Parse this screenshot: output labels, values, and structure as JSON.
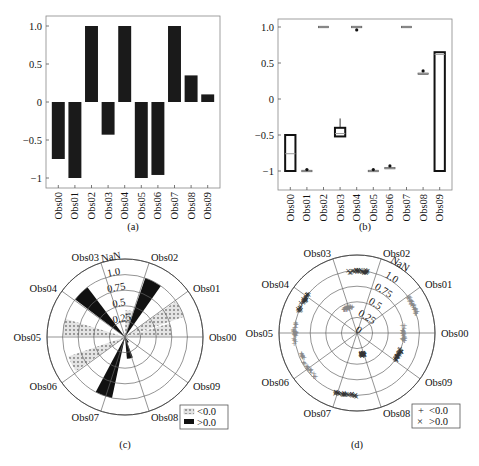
{
  "chart_data": [
    {
      "id": "a",
      "type": "bar",
      "caption": "(a)",
      "categories": [
        "Obs00",
        "Obs01",
        "Obs02",
        "Obs03",
        "Obs04",
        "Obs05",
        "Obs06",
        "Obs07",
        "Obs08",
        "Obs09"
      ],
      "values": [
        -0.75,
        -1.0,
        1.0,
        -0.43,
        1.0,
        -1.0,
        -0.96,
        1.0,
        0.35,
        0.1
      ],
      "yticks": [
        "1.0",
        "0.5",
        "0",
        "-0.5",
        "-1"
      ],
      "ytick_values": [
        1.0,
        0.5,
        0,
        -0.5,
        -1
      ],
      "ylim": [
        -1.1,
        1.1
      ],
      "color": "#1a1a1a",
      "grid": false
    },
    {
      "id": "b",
      "type": "box",
      "caption": "(b)",
      "categories": [
        "Obs00",
        "Obs01",
        "Obs02",
        "Obs03",
        "Obs04",
        "Obs05",
        "Obs06",
        "Obs07",
        "Obs08",
        "Obs09"
      ],
      "boxes": [
        {
          "q1": -1.0,
          "median": -0.76,
          "q3": -0.5,
          "whisker_low": -1.0,
          "whisker_high": -0.5,
          "outliers": []
        },
        {
          "q1": -1.0,
          "median": -1.0,
          "q3": -1.0,
          "whisker_low": -1.0,
          "whisker_high": -1.0,
          "outliers": [
            -0.98
          ]
        },
        {
          "q1": 1.0,
          "median": 1.0,
          "q3": 1.0,
          "whisker_low": 1.0,
          "whisker_high": 1.0,
          "outliers": []
        },
        {
          "q1": -0.52,
          "median": -0.48,
          "q3": -0.4,
          "whisker_low": -0.52,
          "whisker_high": -0.27,
          "outliers": []
        },
        {
          "q1": 0.99,
          "median": 1.0,
          "q3": 1.0,
          "whisker_low": 0.99,
          "whisker_high": 1.0,
          "outliers": [
            0.96
          ]
        },
        {
          "q1": -1.0,
          "median": -1.0,
          "q3": -1.0,
          "whisker_low": -1.0,
          "whisker_high": -1.0,
          "outliers": [
            -0.98
          ]
        },
        {
          "q1": -0.97,
          "median": -0.97,
          "q3": -0.96,
          "whisker_low": -0.97,
          "whisker_high": -0.96,
          "outliers": [
            -0.93
          ]
        },
        {
          "q1": 1.0,
          "median": 1.0,
          "q3": 1.0,
          "whisker_low": 1.0,
          "whisker_high": 1.0,
          "outliers": []
        },
        {
          "q1": 0.33,
          "median": 0.34,
          "q3": 0.35,
          "whisker_low": 0.33,
          "whisker_high": 0.35,
          "outliers": [
            0.39
          ]
        },
        {
          "q1": -1.0,
          "median": 0.62,
          "q3": 0.65,
          "whisker_low": -1.0,
          "whisker_high": 0.65,
          "outliers": []
        }
      ],
      "yticks": [
        "1.0",
        "0.5",
        "0",
        "-0.5",
        "-1"
      ],
      "ytick_values": [
        1.0,
        0.5,
        0,
        -0.5,
        -1
      ],
      "ylim": [
        -1.15,
        1.1
      ],
      "grid": false
    },
    {
      "id": "c",
      "type": "polar_bar",
      "caption": "(c)",
      "categories": [
        "Obs00",
        "Obs01",
        "Obs02",
        "Obs03",
        "Obs04",
        "Obs05",
        "Obs06",
        "Obs07",
        "Obs08",
        "Obs09"
      ],
      "angles_deg": [
        0,
        36,
        72,
        108,
        144,
        180,
        216,
        252,
        288,
        324
      ],
      "values": [
        -0.75,
        -1.0,
        1.0,
        -0.43,
        1.0,
        -1.0,
        -0.96,
        1.0,
        0.35,
        0.1
      ],
      "bars": [
        {
          "label": "Obs00",
          "angle": 9,
          "r": 0.75,
          "sign": "neg"
        },
        {
          "label": "Obs01",
          "angle": 27,
          "r": 1.0,
          "sign": "neg"
        },
        {
          "label": "Obs02",
          "angle": 63,
          "r": 1.0,
          "sign": "pos"
        },
        {
          "label": "Obs03",
          "angle": 81,
          "r": 0.43,
          "sign": "neg"
        },
        {
          "label": "Obs04",
          "angle": 135,
          "r": 1.0,
          "sign": "pos"
        },
        {
          "label": "Obs05",
          "angle": 171,
          "r": 1.0,
          "sign": "neg"
        },
        {
          "label": "Obs06",
          "angle": 207,
          "r": 0.96,
          "sign": "neg"
        },
        {
          "label": "Obs07",
          "angle": 250,
          "r": 1.0,
          "sign": "pos"
        },
        {
          "label": "Obs08",
          "angle": 283,
          "r": 0.35,
          "sign": "pos"
        },
        {
          "label": "Obs09",
          "angle": 300,
          "r": 0.1,
          "sign": "pos"
        }
      ],
      "rticks": [
        "0.25",
        "0.5",
        "0.75",
        "1.0",
        "NaN"
      ],
      "rtick_values": [
        0.25,
        0.5,
        0.75,
        1.0,
        1.25
      ],
      "legend": [
        {
          "label": "<0.0",
          "style": "dotted-gray"
        },
        {
          "label": ">0.0",
          "style": "solid-black"
        }
      ],
      "legend_position": "lower right"
    },
    {
      "id": "d",
      "type": "polar_scatter",
      "caption": "(d)",
      "categories": [
        "Obs00",
        "Obs01",
        "Obs02",
        "Obs03",
        "Obs04",
        "Obs05",
        "Obs06",
        "Obs07",
        "Obs08",
        "Obs09"
      ],
      "angles_deg": [
        0,
        36,
        72,
        108,
        144,
        180,
        216,
        252,
        288,
        324
      ],
      "clusters": [
        {
          "label": "Obs00",
          "angle_range": [
            -10,
            10
          ],
          "r": 0.75,
          "sign": "neg"
        },
        {
          "label": "Obs01",
          "angle_range": [
            18,
            36
          ],
          "r": 1.0,
          "sign": "neg"
        },
        {
          "label": "Obs02",
          "angle_range": [
            80,
            100
          ],
          "r": 1.0,
          "sign": "pos"
        },
        {
          "label": "Obs03",
          "angle_range": [
            100,
            120
          ],
          "r": 0.43,
          "sign": "neg"
        },
        {
          "label": "Obs04",
          "angle_range": [
            140,
            160
          ],
          "r": 1.0,
          "sign": "pos"
        },
        {
          "label": "Obs05",
          "angle_range": [
            170,
            190
          ],
          "r": 1.0,
          "sign": "neg"
        },
        {
          "label": "Obs06",
          "angle_range": [
            200,
            230
          ],
          "r": 0.96,
          "sign": "neg"
        },
        {
          "label": "Obs07",
          "angle_range": [
            250,
            270
          ],
          "r": 1.0,
          "sign": "pos"
        },
        {
          "label": "Obs08",
          "angle_range": [
            280,
            290
          ],
          "r": 0.35,
          "sign": "pos"
        },
        {
          "label": "Obs09",
          "angle_range": [
            325,
            340
          ],
          "r": 0.75,
          "sign": "pos"
        }
      ],
      "rticks": [
        "0",
        "0.25",
        "0.5",
        "0.75",
        "1.0",
        "NaN"
      ],
      "rtick_values": [
        0,
        0.25,
        0.5,
        0.75,
        1.0,
        1.25
      ],
      "legend": [
        {
          "label": "<0.0",
          "marker": "+"
        },
        {
          "label": ">0.0",
          "marker": "×"
        }
      ],
      "legend_position": "lower right"
    }
  ],
  "captions": {
    "a": "(a)",
    "b": "(b)",
    "c": "(c)",
    "d": "(d)"
  },
  "legend_c": {
    "neg": "<0.0",
    "pos": ">0.0"
  },
  "legend_d": {
    "neg": "<0.0",
    "pos": ">0.0",
    "neg_marker": "+",
    "pos_marker": "×"
  }
}
